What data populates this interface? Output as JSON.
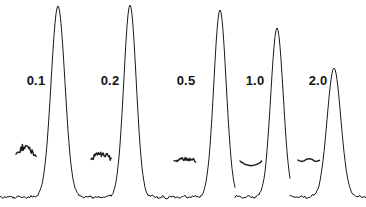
{
  "figure": {
    "kind": "chromatogram-panel",
    "background_color": "#ffffff",
    "trace_color": "#1a1a1a",
    "label_color": "#141414",
    "width": 366,
    "height": 207
  },
  "labels": [
    {
      "text": "0.1",
      "x": 36,
      "y": 80
    },
    {
      "text": "0.2",
      "x": 110,
      "y": 80
    },
    {
      "text": "0.5",
      "x": 186,
      "y": 80
    },
    {
      "text": "1.0",
      "x": 255,
      "y": 80
    },
    {
      "text": "2.0",
      "x": 318,
      "y": 80
    }
  ],
  "chart_data": {
    "type": "line",
    "title": "",
    "xlabel": "",
    "ylabel": "",
    "grid": false,
    "legend": "none",
    "axis_visible": false,
    "baseline_y": 197,
    "series_name": "detector-signal",
    "x": [
      0,
      366
    ],
    "peaks": [
      {
        "label": "0.1",
        "center_x": 58,
        "apex_y": 6,
        "height": 191,
        "half_width": 10,
        "base_half_width": 15
      },
      {
        "label": "0.2",
        "center_x": 130,
        "apex_y": 5,
        "height": 192,
        "half_width": 9,
        "base_half_width": 14
      },
      {
        "label": "0.5",
        "center_x": 220,
        "apex_y": 10,
        "height": 187,
        "half_width": 9,
        "base_half_width": 14
      },
      {
        "label": "1.0",
        "center_x": 277,
        "apex_y": 28,
        "height": 169,
        "half_width": 9,
        "base_half_width": 14
      },
      {
        "label": "2.0",
        "center_x": 334,
        "apex_y": 68,
        "height": 129,
        "half_width": 10,
        "base_half_width": 16
      }
    ],
    "noise_blips": [
      {
        "label": "0.1",
        "center_x": 26,
        "center_y": 155,
        "width": 20,
        "amplitude": 8,
        "style": "spiky"
      },
      {
        "label": "0.2",
        "center_x": 101,
        "center_y": 159,
        "width": 20,
        "amplitude": 5,
        "style": "spiky"
      },
      {
        "label": "0.5",
        "center_x": 185,
        "center_y": 161,
        "width": 22,
        "amplitude": 3,
        "style": "rough"
      },
      {
        "label": "1.0",
        "center_x": 251,
        "center_y": 161,
        "width": 22,
        "amplitude": 3,
        "style": "smooth-dip"
      },
      {
        "label": "2.0",
        "center_x": 309,
        "center_y": 160,
        "width": 22,
        "amplitude": 2,
        "style": "flat"
      }
    ],
    "segment_breaks": [
      93,
      163,
      235,
      290
    ],
    "ylim": [
      0,
      200
    ]
  }
}
